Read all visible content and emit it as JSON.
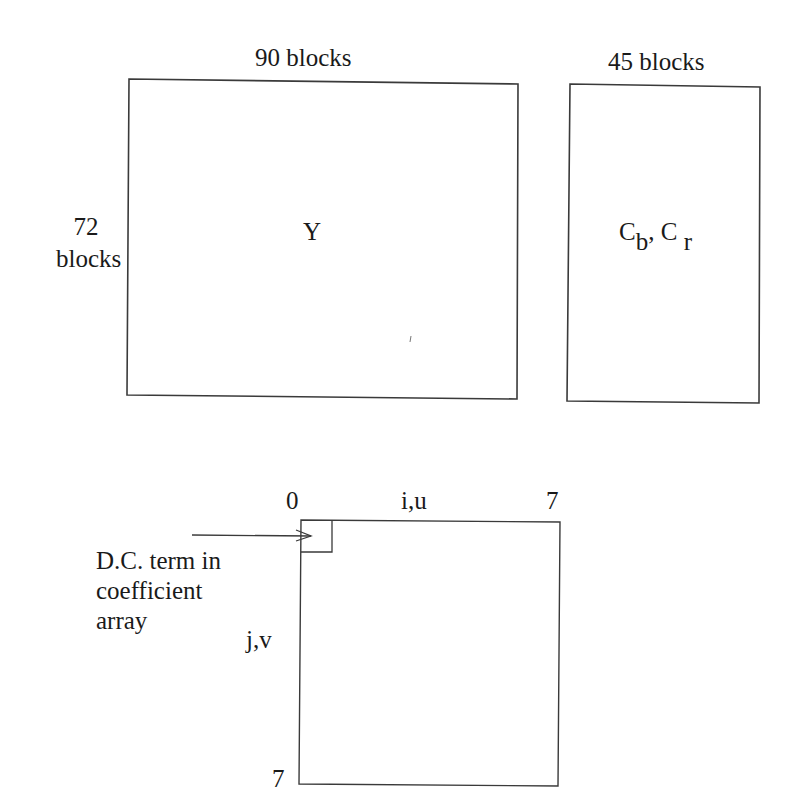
{
  "figure": {
    "luma_plane": {
      "label": "Y",
      "width_label": "90 blocks",
      "height_label_line1": "72",
      "height_label_line2": "blocks"
    },
    "chroma_plane": {
      "label_c1": "C",
      "label_c1_sub": "b",
      "separator": ",",
      "label_c2": "C",
      "label_c2_sub": "r",
      "width_label": "45 blocks"
    },
    "coefficient_block": {
      "top_left_index": "0",
      "top_axis_label": "i,u",
      "top_right_index": "7",
      "left_axis_label": "j,v",
      "bottom_left_index": "7",
      "dc_annotation_line1": "D.C. term in",
      "dc_annotation_line2": "coefficient",
      "dc_annotation_line3": "array"
    }
  },
  "colors": {
    "stroke": "#3a3a3a",
    "text": "#1a1a1a",
    "background": "#ffffff"
  }
}
